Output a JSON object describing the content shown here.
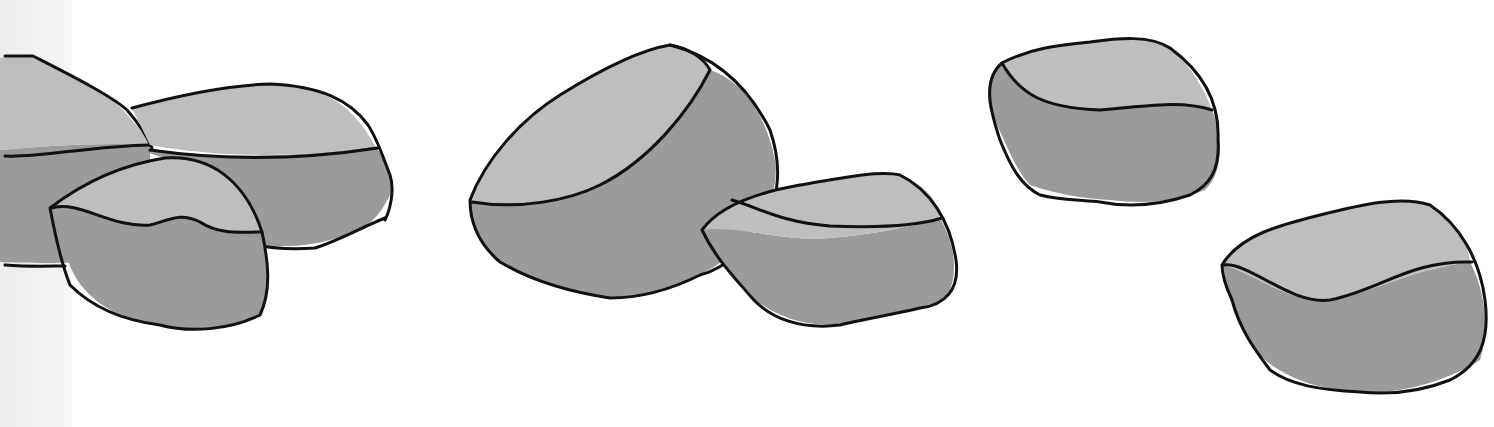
{
  "scene": {
    "title": "Illustration of grey rocks",
    "background": "#ffffff",
    "edge_strip_color": "#efefef",
    "colors": {
      "top_face": "#bebebe",
      "side_face": "#9b9b9b",
      "outline": "#111111"
    },
    "rocks": [
      {
        "name": "rock-far-left",
        "side": "M0,150 C40,147 90,142 150,145 L150,262 C110,262 40,264 0,262 Z",
        "top": "M0,58 C20,55 30,56 35,58 C70,75 110,95 125,112 C140,130 150,140 150,145 C90,142 40,147 0,150 Z",
        "lines": [
          "M5,56 L33,56 C70,75 110,95 127,110 C140,125 148,138 152,148",
          "M5,156 C40,158 90,146 150,145",
          "M5,265 C30,267 50,266 65,266"
        ]
      },
      {
        "name": "rock-back-left",
        "side": "M140,150 C220,158 300,158 375,146 C390,165 395,180 390,195 C380,215 370,230 330,240 C300,248 270,248 240,240 L200,170 Z",
        "top": "M132,108 C180,95 230,85 270,84 C320,86 350,100 375,146 C300,158 220,158 150,145 Z",
        "lines": [
          "M132,108 C180,95 230,85 270,84 C320,86 350,100 368,125 C378,140 384,160 390,175 C395,190 390,210 385,220",
          "M150,150 C220,160 300,160 378,148",
          "M385,218 C360,228 340,240 315,248 C290,250 265,248 245,242"
        ]
      },
      {
        "name": "rock-front-left",
        "side": "M50,208 C80,200 110,228 150,225 C170,220 180,212 200,222 C220,235 240,232 262,232 C268,260 272,290 260,315 C230,330 190,333 160,325 C120,320 80,300 68,260 C60,240 55,225 50,208 Z",
        "top": "M50,208 C80,185 120,165 165,158 C210,155 245,180 262,232 C240,232 220,235 200,222 C180,212 170,220 150,225 C110,228 80,200 50,208 Z",
        "lines": [
          "M50,208 C80,185 120,165 165,158 C210,155 245,180 262,232 C268,260 272,290 260,315 C230,330 190,333 160,325 C120,320 90,305 70,285 C62,265 56,240 50,208",
          "M52,208 C80,200 110,228 150,225 C170,220 180,212 200,222 C220,235 240,232 262,232"
        ]
      },
      {
        "name": "rock-center-big",
        "side": "M470,200 C520,210 570,200 600,185 C650,160 690,110 710,70 C740,80 765,110 775,160 C780,195 760,230 730,255 C700,280 660,295 610,298 C560,290 520,275 495,260 C480,240 470,220 470,200 Z",
        "top": "M470,200 C485,160 520,120 560,95 C600,70 640,50 670,45 C690,48 705,60 710,70 C690,110 650,160 600,185 C570,200 520,210 470,200 Z",
        "lines": [
          "M470,200 C485,160 520,120 560,95 C600,70 640,50 670,45 C710,55 745,80 770,130 C782,165 780,200 760,230 C740,255 720,270 700,275 C670,290 640,298 610,298 C570,292 530,280 500,262 C480,245 470,225 470,200",
          "M472,202 C520,210 570,200 600,185 C650,160 690,110 710,70 C705,60 690,48 670,45"
        ]
      },
      {
        "name": "rock-center-small",
        "side": "M702,230 C740,225 780,242 830,238 C870,235 920,225 940,218 C955,245 960,275 945,300 C910,310 880,318 850,322 C810,330 780,318 755,300 C735,280 712,255 702,230 Z",
        "top": "M702,230 C720,205 760,192 800,185 C840,178 880,170 900,175 C925,185 938,200 940,218 C920,225 870,235 830,238 C780,242 740,225 702,230 Z",
        "lines": [
          "M702,230 C720,205 760,192 800,185 C840,178 880,170 900,175 C930,190 950,220 956,260 C960,290 945,305 920,308 C890,315 860,320 840,325 C800,330 770,318 752,298 C735,278 715,258 702,230",
          "M732,200 C760,208 780,222 830,226 C880,228 920,225 942,218"
        ]
      },
      {
        "name": "rock-top-right",
        "side": "M1002,63 C1020,95 1045,108 1100,110 C1150,108 1180,100 1212,110 C1225,140 1222,175 1205,190 C1180,200 1150,205 1110,200 C1080,198 1060,195 1030,185 C1015,170 1005,140 990,110 C985,90 990,70 1002,63 Z",
        "top": "M1002,63 C1030,48 1060,45 1090,42 C1120,38 1150,35 1170,48 C1190,65 1205,90 1212,110 C1180,100 1150,108 1100,110 C1045,108 1020,95 1002,63 Z",
        "lines": [
          "M1002,63 C1030,48 1060,45 1090,42 C1120,38 1150,35 1170,48 C1200,70 1220,100 1218,140 C1220,170 1210,185 1190,195 C1160,205 1130,208 1100,202 C1080,200 1060,200 1040,195 C1020,185 1010,165 1000,140 C990,110 982,80 1002,63",
          "M1002,63 C1020,95 1045,108 1100,110 C1150,106 1180,100 1212,110"
        ]
      },
      {
        "name": "rock-bottom-right",
        "side": "M1222,265 C1250,270 1290,305 1330,300 C1380,290 1410,270 1470,262 C1485,290 1490,330 1480,360 C1450,380 1400,395 1360,392 C1320,390 1290,380 1265,360 C1245,340 1230,310 1222,265 Z",
        "top": "M1222,265 C1240,235 1280,225 1320,215 C1360,205 1400,195 1430,205 C1455,220 1468,240 1470,262 C1410,270 1380,290 1330,300 C1290,305 1250,270 1222,265 Z",
        "lines": [
          "M1222,265 C1240,235 1280,225 1320,215 C1360,205 1400,195 1430,205 C1460,225 1480,260 1485,300 C1490,340 1480,365 1450,380 C1420,392 1390,395 1360,392 C1320,390 1290,385 1270,370 C1255,350 1240,330 1232,300 C1225,285 1222,275 1222,265",
          "M1224,265 C1250,262 1290,305 1330,300 C1380,290 1410,260 1472,262"
        ]
      }
    ]
  }
}
